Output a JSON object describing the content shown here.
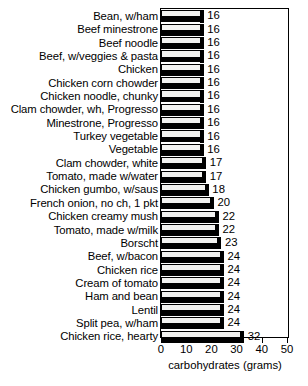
{
  "chart_data": {
    "type": "bar",
    "orientation": "horizontal",
    "title": "",
    "xlabel": "carbohydrates (grams)",
    "ylabel": "",
    "xlim": [
      0,
      50
    ],
    "xticks": [
      0,
      10,
      20,
      30,
      40,
      50
    ],
    "grid": false,
    "legend": null,
    "show_value_labels": true,
    "categories": [
      "Bean, w/ham",
      "Beef minestrone",
      "Beef noodle",
      "Beef, w/veggies & pasta",
      "Chicken",
      "Chicken corn chowder",
      "Chicken noodle, chunky",
      "Clam chowder, wh, Progresso",
      "Minestrone, Progresso",
      "Turkey vegetable",
      "Vegetable",
      "Clam chowder, white",
      "Tomato, made w/water",
      "Chicken gumbo, w/saus",
      "French onion, no ch, 1 pkt",
      "Chicken creamy mush",
      "Tomato, made w/milk",
      "Borscht",
      "Beef, w/bacon",
      "Chicken rice",
      "Cream of tomato",
      "Ham and bean",
      "Lentil",
      "Split pea, w/ham",
      "Chicken rice, hearty"
    ],
    "values": [
      16,
      16,
      16,
      16,
      16,
      16,
      16,
      16,
      16,
      16,
      16,
      17,
      17,
      18,
      20,
      22,
      22,
      23,
      24,
      24,
      24,
      24,
      24,
      24,
      32
    ]
  },
  "axis": {
    "tick_labels": [
      "0",
      "10",
      "20",
      "30",
      "40",
      "50"
    ],
    "title": "carbohydrates (grams)"
  },
  "colors": {
    "bar_face": "#f2f2f0",
    "bar_shadow": "#000000",
    "outline": "#000000",
    "text": "#000000",
    "background": "#ffffff"
  }
}
